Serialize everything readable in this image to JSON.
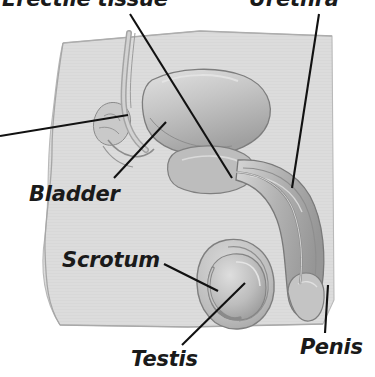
{
  "figure": {
    "type": "anatomical-diagram",
    "rendering": "grayscale halftone illustration",
    "colors": {
      "page_background": "#ffffff",
      "body_silhouette": "#dcdcdc",
      "body_silhouette_edge": "#b4b4b4",
      "organ_light": "#cfcfcf",
      "organ_mid": "#b0b0b0",
      "organ_dark": "#8f8f8f",
      "organ_outline": "#6e6e6e",
      "leader_line": "#111111",
      "label_text": "#1a1a1a"
    },
    "labels": [
      {
        "id": "erectile-tissue",
        "text": "Erectile tissue",
        "position": "top-left",
        "clipped_at_top": true,
        "leader_line": {
          "from": [
            130,
            14
          ],
          "to": [
            232,
            178
          ]
        }
      },
      {
        "id": "urethra",
        "text": "Urethra",
        "position": "top-right",
        "clipped_at_top": true,
        "leader_line": {
          "from": [
            319,
            14
          ],
          "to": [
            292,
            188
          ]
        }
      },
      {
        "id": "bladder",
        "text": "Bladder",
        "position": "left-middle",
        "clipped_at_top": false,
        "leader_line": {
          "from": [
            114,
            178
          ],
          "to": [
            166,
            122
          ]
        }
      },
      {
        "id": "scrotum",
        "text": "Scrotum",
        "position": "left-lower",
        "clipped_at_top": false,
        "leader_line": {
          "from": [
            164,
            264
          ],
          "to": [
            218,
            291
          ]
        }
      },
      {
        "id": "testis",
        "text": "Testis",
        "position": "bottom-center",
        "clipped_at_top": false,
        "leader_line": {
          "from": [
            182,
            345
          ],
          "to": [
            245,
            283
          ]
        }
      },
      {
        "id": "penis",
        "text": "Penis",
        "position": "bottom-right",
        "clipped_at_top": false,
        "leader_line": {
          "from": [
            325,
            333
          ],
          "to": [
            328,
            285
          ]
        }
      }
    ],
    "structures": [
      {
        "id": "body-silhouette",
        "name": "body cross-section block"
      },
      {
        "id": "bladder-organ",
        "name": "bladder"
      },
      {
        "id": "vas-deferens",
        "name": "vas deferens tube"
      },
      {
        "id": "prostate",
        "name": "prostate gland"
      },
      {
        "id": "seminal-vesicle",
        "name": "seminal vesicle"
      },
      {
        "id": "penis-shaft",
        "name": "penis shaft with erectile tissue"
      },
      {
        "id": "urethra-canal",
        "name": "urethra canal"
      },
      {
        "id": "scrotum-sac",
        "name": "scrotum"
      },
      {
        "id": "testis-organ",
        "name": "testis"
      },
      {
        "id": "epididymis",
        "name": "epididymis"
      }
    ]
  }
}
